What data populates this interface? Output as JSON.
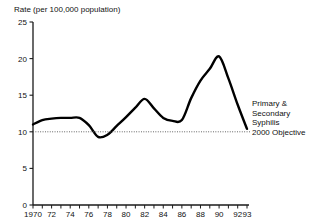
{
  "chart_data": {
    "type": "line",
    "title": "Rate (per 100,000 population)",
    "xlabel": "",
    "ylabel": "Rate (per 100,000 population)",
    "ylim": [
      0,
      25
    ],
    "yticks": [
      0,
      5,
      10,
      15,
      20,
      25
    ],
    "ytick_labels": [
      "0",
      "5",
      "10",
      "15",
      "20",
      "25"
    ],
    "xlim": [
      1970,
      1993
    ],
    "xticks": [
      1970,
      1971,
      1972,
      1973,
      1974,
      1975,
      1976,
      1977,
      1978,
      1979,
      1980,
      1981,
      1982,
      1983,
      1984,
      1985,
      1986,
      1987,
      1988,
      1989,
      1990,
      1991,
      1992,
      1993
    ],
    "xtick_labels": [
      "1970",
      "72",
      "74",
      "76",
      "78",
      "80",
      "82",
      "84",
      "86",
      "88",
      "90",
      "92",
      "93"
    ],
    "xtick_label_years": [
      1970,
      1972,
      1974,
      1976,
      1978,
      1980,
      1982,
      1984,
      1986,
      1988,
      1990,
      1992,
      1993
    ],
    "grid": false,
    "legend_position": "right",
    "series": [
      {
        "name": "Primary & Secondary Syphilis",
        "style": "solid",
        "color": "#000000",
        "x": [
          1970,
          1971,
          1972,
          1973,
          1974,
          1975,
          1976,
          1977,
          1978,
          1979,
          1980,
          1981,
          1982,
          1983,
          1984,
          1985,
          1986,
          1987,
          1988,
          1989,
          1990,
          1991,
          1992,
          1993
        ],
        "values": [
          11.0,
          11.6,
          11.8,
          11.9,
          11.9,
          11.9,
          10.9,
          9.3,
          9.6,
          10.8,
          12.0,
          13.3,
          14.5,
          13.2,
          11.9,
          11.5,
          11.6,
          14.6,
          17.0,
          18.6,
          20.3,
          17.3,
          13.7,
          10.4
        ]
      },
      {
        "name": "2000 Objective",
        "style": "dotted",
        "color": "#555555",
        "x": [
          1970,
          1993
        ],
        "values": [
          10.0,
          10.0
        ]
      }
    ]
  },
  "legend": {
    "series_line1": "Primary &",
    "series_line2": "Secondary",
    "series_line3": "Syphilis",
    "objective": "2000 Objective"
  }
}
